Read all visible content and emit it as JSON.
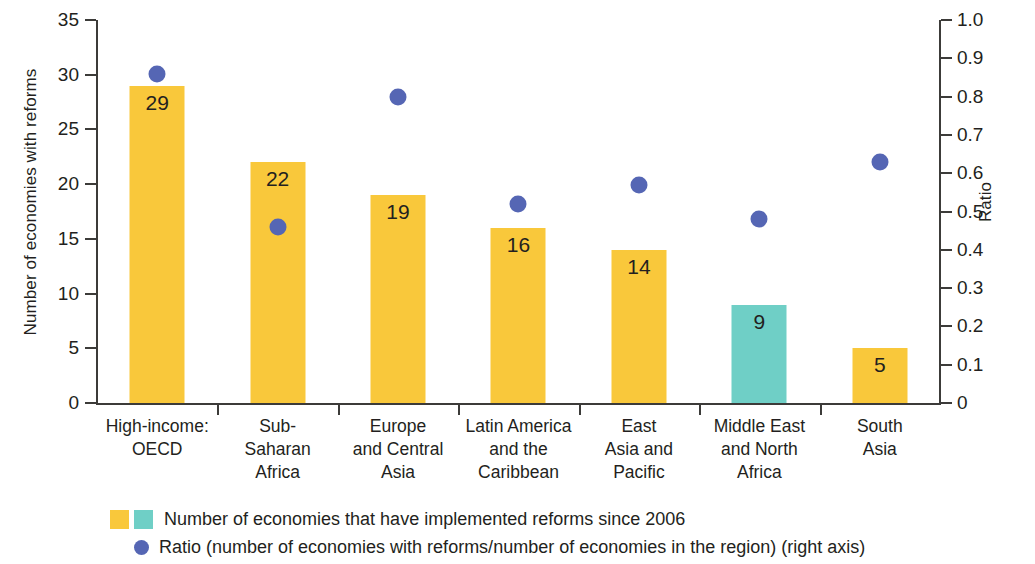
{
  "chart_data": {
    "type": "bar",
    "title": "",
    "subtitle": "",
    "xlabel": "",
    "ylabel": "Number of economies with reforms",
    "y2label": "Ratio",
    "ylim": [
      0,
      35
    ],
    "y2lim": [
      0,
      1.0
    ],
    "grid": false,
    "legend_position": "bottom",
    "categories": [
      "High-income: OECD",
      "Sub-Saharan Africa",
      "Europe and Central Asia",
      "Latin America and the Caribbean",
      "East Asia and Pacific",
      "Middle East and North Africa",
      "South Asia"
    ],
    "category_lines": [
      [
        "High-income:",
        "OECD"
      ],
      [
        "Sub-",
        "Saharan",
        "Africa"
      ],
      [
        "Europe",
        "and Central",
        "Asia"
      ],
      [
        "Latin America",
        "and the",
        "Caribbean"
      ],
      [
        "East",
        "Asia and",
        "Pacific"
      ],
      [
        "Middle East",
        "and North",
        "Africa"
      ],
      [
        "South",
        "Asia"
      ]
    ],
    "series": [
      {
        "name": "Number of economies that have implemented reforms since 2006",
        "type": "bar",
        "axis": "left",
        "values": [
          29,
          22,
          19,
          16,
          14,
          9,
          5
        ],
        "colors": [
          "#f9c83b",
          "#f9c83b",
          "#f9c83b",
          "#f9c83b",
          "#f9c83b",
          "#6fcfc6",
          "#f9c83b"
        ]
      },
      {
        "name": "Ratio (number of economies with reforms/number of economies in the region) (right axis)",
        "type": "scatter",
        "axis": "right",
        "values": [
          0.86,
          0.46,
          0.8,
          0.52,
          0.57,
          0.48,
          0.63
        ],
        "color": "#5566b4"
      }
    ],
    "y_ticks": [
      "0",
      "5",
      "10",
      "15",
      "20",
      "25",
      "30",
      "35"
    ],
    "y2_ticks": [
      "0",
      "0.1",
      "0.2",
      "0.3",
      "0.4",
      "0.5",
      "0.6",
      "0.7",
      "0.8",
      "0.9",
      "1.0"
    ]
  },
  "axes": {
    "left_title": "Number of economies with reforms",
    "right_title": "Ratio",
    "left_ticks": [
      "0",
      "5",
      "10",
      "15",
      "20",
      "25",
      "30",
      "35"
    ],
    "right_ticks": [
      "0",
      "0.1",
      "0.2",
      "0.3",
      "0.4",
      "0.5",
      "0.6",
      "0.7",
      "0.8",
      "0.9",
      "1.0"
    ]
  },
  "legend": {
    "bars_label": "Number of economies that have implemented reforms since 2006",
    "dots_label": "Ratio (number of economies with reforms/number of economies in the region) (right axis)"
  },
  "colors": {
    "bar_yellow": "#f9c83b",
    "bar_teal": "#6fcfc6",
    "dot_blue": "#5566b4",
    "axis": "#3c3b39",
    "text": "#231f20"
  }
}
